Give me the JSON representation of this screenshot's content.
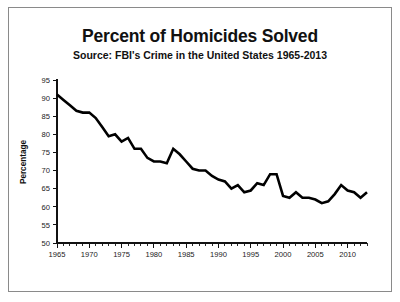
{
  "chart_data": {
    "type": "line",
    "title": "Percent of Homicides Solved",
    "subtitle": "Source: FBI's Crime in the United States 1965-2013",
    "xlabel": "",
    "ylabel": "Percentage",
    "ylim": [
      50,
      95
    ],
    "xlim": [
      1965,
      2013
    ],
    "ytick_step": 5,
    "xtick_step": 5,
    "xtick_minor_step": 1,
    "grid": false,
    "legend": "none",
    "line_color": "#000000",
    "yticks": [
      50,
      55,
      60,
      65,
      70,
      75,
      80,
      85,
      90,
      95
    ],
    "ytick_labels": [
      "50",
      "55",
      "60",
      "65",
      "70",
      "75",
      "80",
      "85",
      "90",
      "95"
    ],
    "xticks": [
      1965,
      1970,
      1975,
      1980,
      1985,
      1990,
      1995,
      2000,
      2005,
      2010
    ],
    "xtick_labels": [
      "1965",
      "1970",
      "1975",
      "1980",
      "1985",
      "1990",
      "1995",
      "2000",
      "2005",
      "2010"
    ],
    "x": [
      1965,
      1966,
      1967,
      1968,
      1969,
      1970,
      1971,
      1972,
      1973,
      1974,
      1975,
      1976,
      1977,
      1978,
      1979,
      1980,
      1981,
      1982,
      1983,
      1984,
      1985,
      1986,
      1987,
      1988,
      1989,
      1990,
      1991,
      1992,
      1993,
      1994,
      1995,
      1996,
      1997,
      1998,
      1999,
      2000,
      2001,
      2002,
      2003,
      2004,
      2005,
      2006,
      2007,
      2008,
      2009,
      2010,
      2011,
      2012,
      2013
    ],
    "values": [
      91.0,
      89.5,
      88.0,
      86.5,
      86.0,
      86.0,
      84.5,
      82.0,
      79.5,
      80.0,
      78.0,
      79.0,
      76.0,
      76.0,
      73.5,
      72.5,
      72.5,
      72.0,
      76.0,
      74.5,
      72.5,
      70.5,
      70.0,
      70.0,
      68.5,
      67.5,
      67.0,
      65.0,
      66.0,
      64.0,
      64.5,
      66.5,
      66.0,
      69.0,
      69.0,
      63.0,
      62.5,
      64.0,
      62.5,
      62.5,
      62.0,
      61.0,
      61.5,
      63.5,
      66.0,
      64.5,
      64.0,
      62.5,
      64.0
    ],
    "series": [
      {
        "name": "Percent of homicides solved",
        "values": [
          91.0,
          89.5,
          88.0,
          86.5,
          86.0,
          86.0,
          84.5,
          82.0,
          79.5,
          80.0,
          78.0,
          79.0,
          76.0,
          76.0,
          73.5,
          72.5,
          72.5,
          72.0,
          76.0,
          74.5,
          72.5,
          70.5,
          70.0,
          70.0,
          68.5,
          67.5,
          67.0,
          65.0,
          66.0,
          64.0,
          64.5,
          66.5,
          66.0,
          69.0,
          69.0,
          63.0,
          62.5,
          64.0,
          62.5,
          62.5,
          62.0,
          61.0,
          61.5,
          63.5,
          66.0,
          64.5,
          64.0,
          62.5,
          64.0
        ]
      }
    ]
  }
}
